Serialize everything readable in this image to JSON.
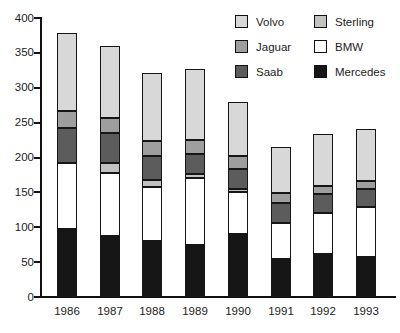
{
  "chart_data": {
    "type": "bar",
    "stacked": true,
    "title": "",
    "xlabel": "",
    "ylabel": "",
    "ylim": [
      0,
      400
    ],
    "ytick_step": 50,
    "grid": false,
    "legend_position": "top-right",
    "categories": [
      "1986",
      "1987",
      "1988",
      "1989",
      "1990",
      "1991",
      "1992",
      "1993"
    ],
    "series_bottom_to_top": [
      {
        "name": "Mercedes",
        "color": "#161616",
        "values": [
          98,
          87,
          80,
          74,
          90,
          55,
          61,
          58
        ]
      },
      {
        "name": "BMW",
        "color": "#ffffff",
        "values": [
          95,
          91,
          77,
          96,
          60,
          52,
          59,
          71
        ]
      },
      {
        "name": "Sterling",
        "color": "#c2c2c2",
        "values": [
          0,
          14,
          10,
          6,
          5,
          0,
          0,
          0
        ]
      },
      {
        "name": "Saab",
        "color": "#5c5c5c",
        "values": [
          50,
          43,
          34,
          29,
          28,
          29,
          27,
          26
        ]
      },
      {
        "name": "Jaguar",
        "color": "#9e9e9e",
        "values": [
          25,
          22,
          21,
          20,
          19,
          14,
          12,
          12
        ]
      },
      {
        "name": "Volvo",
        "color": "#d8d8d8",
        "values": [
          112,
          103,
          98,
          102,
          77,
          66,
          75,
          75
        ]
      }
    ],
    "totals": [
      380,
      360,
      320,
      327,
      279,
      216,
      234,
      242
    ]
  },
  "y_axis": {
    "tick_labels": [
      "0",
      "50",
      "100",
      "150",
      "200",
      "250",
      "300",
      "350",
      "400"
    ]
  },
  "x_axis": {
    "labels": [
      "1986",
      "1987",
      "1988",
      "1989",
      "1990",
      "1991",
      "1992",
      "1993"
    ]
  },
  "legend": {
    "columns": [
      {
        "items": [
          {
            "label": "Volvo",
            "color": "#d8d8d8"
          },
          {
            "label": "Jaguar",
            "color": "#9e9e9e"
          },
          {
            "label": "Saab",
            "color": "#5c5c5c"
          }
        ]
      },
      {
        "items": [
          {
            "label": "Sterling",
            "color": "#c2c2c2"
          },
          {
            "label": "BMW",
            "color": "#ffffff"
          },
          {
            "label": "Mercedes",
            "color": "#161616"
          }
        ]
      }
    ]
  }
}
